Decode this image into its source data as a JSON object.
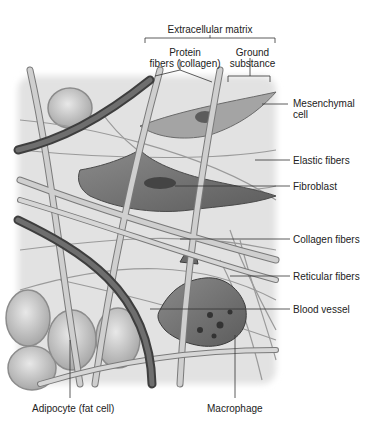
{
  "figure": {
    "header": {
      "group_label": "Extracellular matrix",
      "subgroups": [
        {
          "label_line1": "Protein",
          "label_line2": "fibers (collagen)"
        },
        {
          "label_line1": "Ground",
          "label_line2": "substance"
        }
      ]
    },
    "right_labels": [
      {
        "line1": "Mesenchymal",
        "line2": "cell"
      },
      {
        "line1": "Elastic fibers"
      },
      {
        "line1": "Fibroblast"
      },
      {
        "line1": "Collagen fibers"
      },
      {
        "line1": "Reticular fibers"
      },
      {
        "line1": "Blood vessel"
      }
    ],
    "bottom_labels": [
      {
        "line1": "Adipocyte (fat cell)"
      },
      {
        "line1": "Macrophage"
      }
    ],
    "colors": {
      "background": "#ffffff",
      "tissue_bg": "#e4e4e4",
      "fiber_dark": "#5a5a5a",
      "fiber_light": "#bdbdbd",
      "cell": "#7a7a7a",
      "leader_line": "#333333"
    }
  }
}
